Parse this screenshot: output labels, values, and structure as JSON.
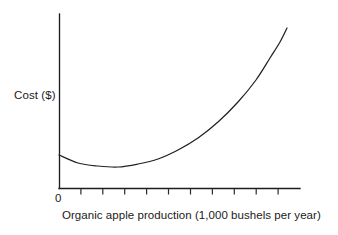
{
  "chart_data": {
    "type": "line",
    "title": "",
    "xlabel": "Organic apple production (1,000 bushels per year)",
    "ylabel": "Cost ($)",
    "origin_label": "0",
    "grid": false,
    "legend": null,
    "axes": {
      "x_range_px": [
        59,
        300
      ],
      "y_range_px": [
        14,
        188
      ],
      "x_tick_count": 10,
      "x_tick_labels": [],
      "y_tick_labels": [],
      "x_ticks_visible": true,
      "y_ticks_visible": false
    },
    "series": [
      {
        "name": "Total cost curve",
        "shape": "u-shaped-then-steeply-rising",
        "stroke_color": "#222222",
        "x": [
          0.0,
          0.08,
          0.16,
          0.245,
          0.33,
          0.42,
          0.5,
          0.58,
          0.66,
          0.73,
          0.8,
          0.86,
          0.91,
          0.955,
          0.985,
          1.0
        ],
        "y": [
          0.19,
          0.145,
          0.125,
          0.122,
          0.137,
          0.168,
          0.215,
          0.275,
          0.345,
          0.42,
          0.505,
          0.6,
          0.695,
          0.795,
          0.875,
          0.92
        ],
        "points_px": [
          {
            "x": 59,
            "y": 155
          },
          {
            "x": 78,
            "y": 163
          },
          {
            "x": 98,
            "y": 166
          },
          {
            "x": 118,
            "y": 167
          },
          {
            "x": 138,
            "y": 164
          },
          {
            "x": 158,
            "y": 159
          },
          {
            "x": 178,
            "y": 150
          },
          {
            "x": 198,
            "y": 138
          },
          {
            "x": 218,
            "y": 122
          },
          {
            "x": 238,
            "y": 102
          },
          {
            "x": 256,
            "y": 80
          },
          {
            "x": 270,
            "y": 58
          },
          {
            "x": 280,
            "y": 42
          },
          {
            "x": 287,
            "y": 28
          }
        ]
      }
    ],
    "annotations": []
  },
  "figure": {
    "background_color": "#ffffff",
    "axis_color": "#1d1d1d",
    "curve_color": "#222222"
  }
}
